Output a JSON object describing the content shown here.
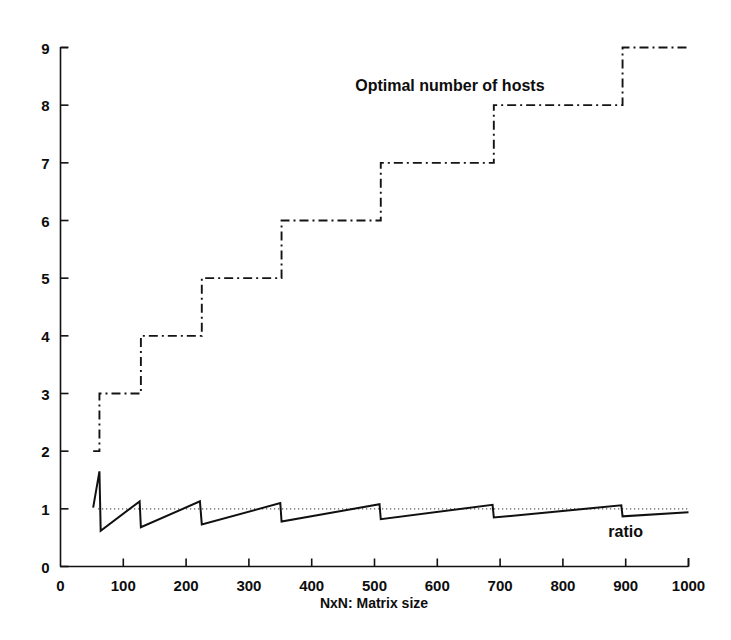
{
  "chart_data": {
    "type": "line",
    "title": "",
    "xlabel": "NxN: Matrix size",
    "ylabel": "",
    "xlim": [
      0,
      1000
    ],
    "ylim": [
      0,
      9
    ],
    "xticks": [
      0,
      100,
      200,
      300,
      400,
      500,
      600,
      700,
      800,
      900,
      1000
    ],
    "yticks": [
      0,
      1,
      2,
      3,
      4,
      5,
      6,
      7,
      8,
      9
    ],
    "xtick_labels": [
      "0",
      "100",
      "200",
      "300",
      "400",
      "500",
      "600",
      "700",
      "800",
      "900",
      "1000"
    ],
    "ytick_labels": [
      "0",
      "1",
      "2",
      "3",
      "4",
      "5",
      "6",
      "7",
      "8",
      "9"
    ],
    "grid": false,
    "legend_position": "inline-annotations",
    "reference_line": {
      "name": "unit ratio reference",
      "y": 1,
      "style": "dotted",
      "x_from": 60,
      "x_to": 1000
    },
    "annotations": [
      {
        "text": "Optimal number of hosts",
        "x": 620,
        "y": 8.25
      },
      {
        "text": "ratio",
        "x": 900,
        "y": 0.52
      }
    ],
    "series": [
      {
        "name": "Optimal number of hosts",
        "label": "Optimal number of hosts",
        "style": "dash-dot",
        "type": "step",
        "color": "#141414",
        "steps": [
          {
            "x_start": 52,
            "x_end": 62,
            "value": 2
          },
          {
            "x_start": 62,
            "x_end": 128,
            "value": 3
          },
          {
            "x_start": 128,
            "x_end": 225,
            "value": 4
          },
          {
            "x_start": 225,
            "x_end": 352,
            "value": 5
          },
          {
            "x_start": 352,
            "x_end": 510,
            "value": 6
          },
          {
            "x_start": 510,
            "x_end": 690,
            "value": 7
          },
          {
            "x_start": 690,
            "x_end": 895,
            "value": 8
          },
          {
            "x_start": 895,
            "x_end": 1000,
            "value": 9
          }
        ]
      },
      {
        "name": "ratio",
        "label": "ratio",
        "style": "solid",
        "type": "sawtooth",
        "color": "#101010",
        "points": [
          [
            52,
            1.02
          ],
          [
            62,
            1.65
          ],
          [
            64,
            0.62
          ],
          [
            126,
            1.13
          ],
          [
            128,
            0.68
          ],
          [
            222,
            1.13
          ],
          [
            225,
            0.73
          ],
          [
            350,
            1.1
          ],
          [
            352,
            0.78
          ],
          [
            508,
            1.08
          ],
          [
            510,
            0.82
          ],
          [
            688,
            1.07
          ],
          [
            690,
            0.85
          ],
          [
            893,
            1.06
          ],
          [
            895,
            0.87
          ],
          [
            1000,
            0.94
          ]
        ]
      }
    ]
  },
  "axis": {
    "x_title": "NxN: Matrix size"
  }
}
